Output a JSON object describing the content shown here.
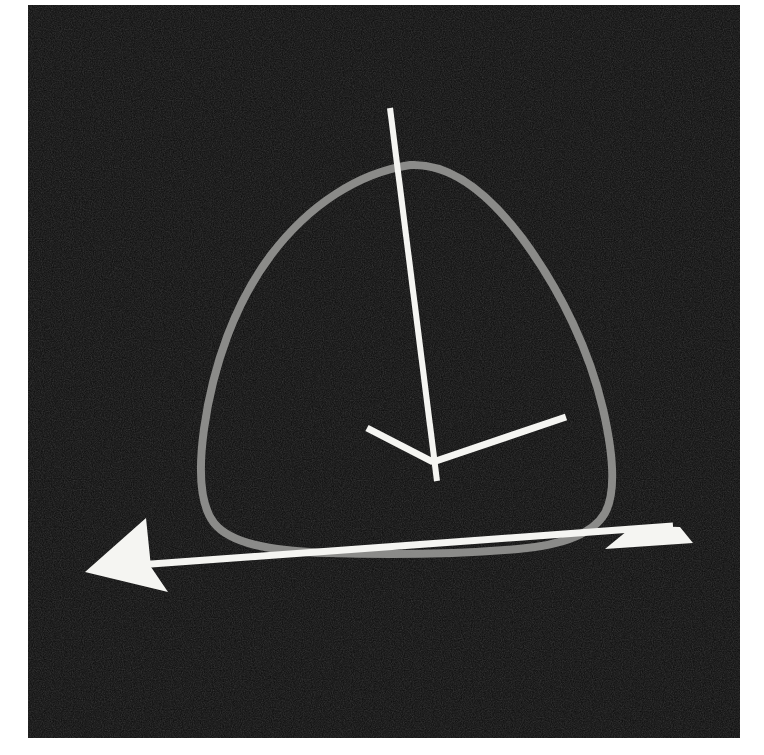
{
  "page": {
    "background_color": "#ffffff",
    "width": 764,
    "height": 755
  },
  "figure": {
    "name": "three-dimensional-axes-with-rounded-triangle-curve",
    "photo_region": {
      "x": 28,
      "y": 5,
      "width": 712,
      "height": 733
    },
    "background_color": "#0b0b0b",
    "grain": true,
    "caption": "",
    "axis_color": "#f5f5f2",
    "curve_color": "#8a8a88",
    "curve_width": 8,
    "axis_width": 7,
    "origin": {
      "x": 433,
      "y": 462
    },
    "axes": [
      {
        "name": "vertical-axis",
        "label": "",
        "from": {
          "x": 390,
          "y": 108
        },
        "to": {
          "x": 437,
          "y": 481
        },
        "arrow": "none"
      },
      {
        "name": "diagonal-axis-left-arrow",
        "label": "",
        "from": {
          "x": 433,
          "y": 462
        },
        "to": {
          "x": 85,
          "y": 572
        },
        "arrow": "end",
        "arrow_tip": {
          "x": 85,
          "y": 572
        }
      },
      {
        "name": "diagonal-axis-right-arrow",
        "label": "",
        "from": {
          "x": 433,
          "y": 462
        },
        "to": {
          "x": 680,
          "y": 527
        },
        "arrow": "end",
        "arrow_tip": {
          "x": 680,
          "y": 527
        }
      },
      {
        "name": "short-axis-stub-upper-left",
        "label": "",
        "from": {
          "x": 433,
          "y": 462
        },
        "to": {
          "x": 367,
          "y": 428
        },
        "arrow": "none"
      },
      {
        "name": "axis-segment-upper-right",
        "label": "",
        "from": {
          "x": 433,
          "y": 462
        },
        "to": {
          "x": 566,
          "y": 417
        },
        "arrow": "none"
      }
    ],
    "curve": {
      "name": "rounded-triangle-curve",
      "description": "closed rounded triangular (Reuleaux-like) loop drawn in gray",
      "apex": {
        "x": 410,
        "y": 165
      },
      "left_extreme": {
        "x": 201,
        "y": 487
      },
      "bottom": {
        "x": 405,
        "y": 552
      },
      "right_extreme": {
        "x": 603,
        "y": 483
      }
    }
  },
  "chart_data": {
    "type": "line",
    "title": "",
    "xlabel": "",
    "ylabel": "",
    "legend": [],
    "annotations": [],
    "series": [
      {
        "name": "rounded-triangle-curve",
        "closed": true,
        "color": "#8a8a88",
        "points": [
          [
            410,
            165
          ],
          [
            352,
            178
          ],
          [
            300,
            213
          ],
          [
            262,
            260
          ],
          [
            229,
            320
          ],
          [
            210,
            390
          ],
          [
            201,
            450
          ],
          [
            203,
            492
          ],
          [
            216,
            522
          ],
          [
            246,
            541
          ],
          [
            300,
            550
          ],
          [
            370,
            553
          ],
          [
            445,
            552
          ],
          [
            512,
            546
          ],
          [
            560,
            533
          ],
          [
            589,
            513
          ],
          [
            602,
            487
          ],
          [
            601,
            445
          ],
          [
            589,
            390
          ],
          [
            566,
            330
          ],
          [
            534,
            272
          ],
          [
            494,
            221
          ],
          [
            452,
            184
          ],
          [
            410,
            165
          ]
        ]
      }
    ]
  }
}
